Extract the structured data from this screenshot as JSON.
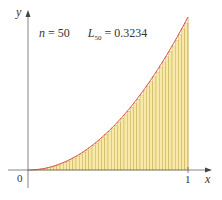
{
  "chart_data": {
    "type": "bar",
    "title": "",
    "function": "y = x^2",
    "n": 50,
    "annotation": {
      "n_label": "n",
      "n_value": "= 50",
      "L_label": "L",
      "L_sub": "50",
      "L_value": "= 0.3234"
    },
    "xlabel": "x",
    "ylabel": "y",
    "x_ticks": [
      "0",
      "1"
    ],
    "xlim": [
      0,
      1
    ],
    "ylim": [
      0,
      1
    ],
    "grid": false,
    "colors": {
      "rect_fill": "#f7eaa8",
      "rect_line": "#b8962e",
      "curve": "#d8443a",
      "axis": "#555555"
    }
  }
}
